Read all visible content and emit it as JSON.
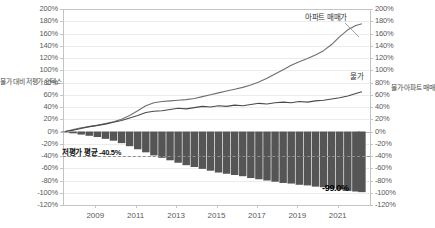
{
  "chart_data": {
    "type": "line",
    "title": "",
    "xlabel": "",
    "ylabel_left": "물가 대비 저평가 인덱스",
    "ylabel_right": "물가·아파트 매매가 증감률",
    "ylim": [
      -120,
      200
    ],
    "ytick_labels": [
      "200%",
      "180%",
      "160%",
      "140%",
      "120%",
      "100%",
      "80%",
      "60%",
      "40%",
      "20%",
      "0%",
      "-20%",
      "-40%",
      "-60%",
      "-80%",
      "-100%",
      "-120%"
    ],
    "ytick_values": [
      200,
      180,
      160,
      140,
      120,
      100,
      80,
      60,
      40,
      20,
      0,
      -20,
      -40,
      -60,
      -80,
      -100,
      -120
    ],
    "xtick_labels": [
      "2009",
      "2011",
      "2013",
      "2015",
      "2017",
      "2019",
      "2021"
    ],
    "xtick_values": [
      2009,
      2011,
      2013,
      2015,
      2017,
      2019,
      2021
    ],
    "xlim": [
      2007.4,
      2022.6
    ],
    "grid": true,
    "legend_position": "inline-annotation",
    "series": [
      {
        "name": "아파트 매매가",
        "type": "line",
        "color": "#6f6f6f",
        "label_text": "아파트 매매가",
        "x": [
          2007.5,
          2007.9,
          2008.3,
          2008.7,
          2009.1,
          2009.5,
          2009.9,
          2010.3,
          2010.7,
          2011.1,
          2011.5,
          2011.9,
          2012.3,
          2012.7,
          2013.1,
          2013.5,
          2013.9,
          2014.3,
          2014.7,
          2015.1,
          2015.5,
          2015.9,
          2016.3,
          2016.7,
          2017.1,
          2017.5,
          2017.9,
          2018.3,
          2018.7,
          2019.1,
          2019.5,
          2019.9,
          2020.3,
          2020.7,
          2021.1,
          2021.5,
          2021.9,
          2022.2
        ],
        "values": [
          0,
          3,
          6,
          8,
          10,
          13,
          16,
          20,
          26,
          34,
          42,
          47,
          49,
          50,
          51,
          52,
          54,
          57,
          60,
          63,
          66,
          69,
          72,
          76,
          81,
          87,
          94,
          101,
          108,
          114,
          119,
          125,
          132,
          142,
          155,
          166,
          173,
          176
        ]
      },
      {
        "name": "물가",
        "type": "line",
        "color": "#4a4a4a",
        "label_text": "물가",
        "x": [
          2007.5,
          2007.9,
          2008.3,
          2008.7,
          2009.1,
          2009.5,
          2009.9,
          2010.3,
          2010.7,
          2011.1,
          2011.5,
          2011.9,
          2012.3,
          2012.7,
          2013.1,
          2013.5,
          2013.9,
          2014.3,
          2014.7,
          2015.1,
          2015.5,
          2015.9,
          2016.3,
          2016.7,
          2017.1,
          2017.5,
          2017.9,
          2018.3,
          2018.7,
          2019.1,
          2019.5,
          2019.9,
          2020.3,
          2020.7,
          2021.1,
          2021.5,
          2021.9,
          2022.2
        ],
        "values": [
          0,
          2,
          5,
          8,
          10,
          12,
          15,
          18,
          22,
          26,
          31,
          33,
          34,
          36,
          38,
          37,
          39,
          41,
          40,
          42,
          41,
          43,
          42,
          44,
          46,
          45,
          47,
          48,
          47,
          49,
          48,
          50,
          51,
          53,
          55,
          58,
          62,
          65
        ]
      },
      {
        "name": "물가 대비 저평가 인덱스",
        "type": "bar",
        "color": "#555555",
        "x": [
          2007.5,
          2007.9,
          2008.3,
          2008.7,
          2009.1,
          2009.5,
          2009.9,
          2010.3,
          2010.7,
          2011.1,
          2011.5,
          2011.9,
          2012.3,
          2012.7,
          2013.1,
          2013.5,
          2013.9,
          2014.3,
          2014.7,
          2015.1,
          2015.5,
          2015.9,
          2016.3,
          2016.7,
          2017.1,
          2017.5,
          2017.9,
          2018.3,
          2018.7,
          2019.1,
          2019.5,
          2019.9,
          2020.3,
          2020.7,
          2021.1,
          2021.5,
          2021.9,
          2022.2
        ],
        "values": [
          -1,
          -3,
          -5,
          -7,
          -9,
          -12,
          -15,
          -19,
          -24,
          -29,
          -34,
          -39,
          -43,
          -47,
          -51,
          -55,
          -58,
          -61,
          -64,
          -67,
          -69,
          -71,
          -73,
          -76,
          -78,
          -80,
          -82,
          -84,
          -85,
          -87,
          -88,
          -90,
          -91,
          -93,
          -95,
          -97,
          -98,
          -99
        ]
      }
    ],
    "annotations": [
      {
        "name": "apartment-price-label",
        "text": "아파트 매매가",
        "value_pct": 180
      },
      {
        "name": "cpi-label",
        "text": "물가",
        "value_pct": 72
      },
      {
        "name": "undervalued-average-label",
        "text": "저평가 평균 -40.5%",
        "value": -40.5,
        "dashed_line": true
      },
      {
        "name": "minimum-value-label",
        "text": "-99.0%",
        "value": -99.0
      }
    ],
    "colors": {
      "apartment_line": "#6f6f6f",
      "cpi_line": "#4a4a4a",
      "bars": "#555555",
      "grid": "#ececec",
      "axis": "#c4c4c4",
      "dashed": "#8d8d8d",
      "text": "#5a5a5a"
    }
  }
}
